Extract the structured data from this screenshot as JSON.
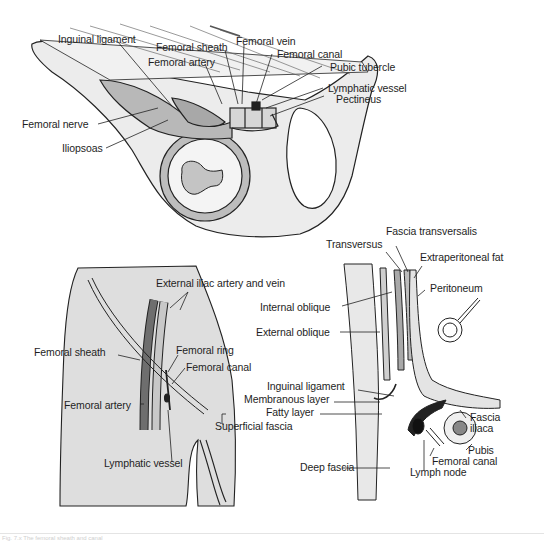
{
  "figure": {
    "panels": [
      {
        "id": "top",
        "description": "Hip bone with femoral sheath beneath inguinal ligament",
        "labels": [
          "Inguinal ligament",
          "Femoral sheath",
          "Femoral vein",
          "Femoral canal",
          "Femoral artery",
          "Pubic tubercle",
          "Lymphatic vessel",
          "Pectineus",
          "Femoral nerve",
          "Iliopsoas"
        ]
      },
      {
        "id": "bottom-left",
        "description": "Anterior thigh showing femoral sheath",
        "labels": [
          "External iliac artery and vein",
          "Femoral ring",
          "Femoral sheath",
          "Femoral canal",
          "Femoral artery",
          "Lymphatic vessel"
        ]
      },
      {
        "id": "bottom-right",
        "description": "Sagittal section of abdominal wall layers and femoral canal",
        "labels": [
          "Fascia transversalis",
          "Transversus",
          "Extraperitoneal fat",
          "Peritoneum",
          "Internal oblique",
          "External oblique",
          "Inguinal ligament",
          "Membranous layer",
          "Fatty layer",
          "Superficial fascia",
          "Deep fascia",
          "Fascia iliaca",
          "Pubis",
          "Femoral canal",
          "Lymph node"
        ]
      }
    ],
    "caption": "Fig. 7.x  The femoral sheath and canal"
  },
  "colors": {
    "bone": "#e9e9e9",
    "thigh": "#dcdcdc",
    "muscle": "#b9b9b9",
    "artery_dark": "#6e6e6e",
    "vein_light": "#c8c8c8",
    "ink": "#1e1e1e"
  }
}
